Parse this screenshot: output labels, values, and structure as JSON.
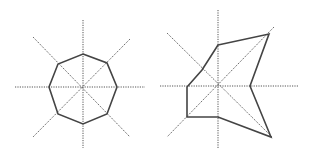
{
  "diagram": {
    "colors": {
      "axis": "#555555",
      "polygon": "#444444",
      "background": "#ffffff"
    },
    "panels": [
      {
        "name": "regular-octagon",
        "center": [
          83,
          87
        ],
        "axes": [
          [
            [
              83,
              20
            ],
            [
              83,
              148
            ]
          ],
          [
            [
              15,
              87
            ],
            [
              145,
              87
            ]
          ],
          [
            [
              33,
              37
            ],
            [
              130,
              137
            ]
          ],
          [
            [
              130,
              39
            ],
            [
              33,
              137
            ]
          ]
        ],
        "polygon": [
          [
            83,
            54
          ],
          [
            107,
            63
          ],
          [
            117,
            87
          ],
          [
            107,
            114
          ],
          [
            83,
            124
          ],
          [
            58,
            114
          ],
          [
            49,
            87
          ],
          [
            58,
            64
          ]
        ]
      },
      {
        "name": "irregular-star",
        "center": [
          218,
          86
        ],
        "axes": [
          [
            [
              218,
              10
            ],
            [
              218,
              148
            ]
          ],
          [
            [
              160,
              86
            ],
            [
              298,
              86
            ]
          ],
          [
            [
              167,
              33
            ],
            [
              272,
              137
            ]
          ],
          [
            [
              274,
              27
            ],
            [
              167,
              137
            ]
          ]
        ],
        "polygon": [
          [
            218,
            45
          ],
          [
            269,
            34
          ],
          [
            250,
            86
          ],
          [
            271,
            137
          ],
          [
            218,
            117
          ],
          [
            187,
            117
          ],
          [
            187,
            87
          ],
          [
            202,
            70
          ]
        ]
      }
    ]
  }
}
